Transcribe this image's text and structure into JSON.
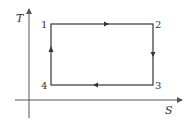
{
  "diagram": {
    "type": "T-S diagram (Carnot cycle)",
    "axes": {
      "y_label": "T",
      "x_label": "S"
    },
    "points": [
      {
        "id": "1",
        "label": "1",
        "position": "top-left"
      },
      {
        "id": "2",
        "label": "2",
        "position": "top-right"
      },
      {
        "id": "3",
        "label": "3",
        "position": "bottom-right"
      },
      {
        "id": "4",
        "label": "4",
        "position": "bottom-left"
      }
    ],
    "edges": [
      {
        "from": "1",
        "to": "2",
        "direction": "right"
      },
      {
        "from": "2",
        "to": "3",
        "direction": "down"
      },
      {
        "from": "3",
        "to": "4",
        "direction": "left"
      },
      {
        "from": "4",
        "to": "1",
        "direction": "up"
      }
    ],
    "colors": {
      "axis": "#555555",
      "cycle": "#444444",
      "text": "#333333"
    }
  }
}
